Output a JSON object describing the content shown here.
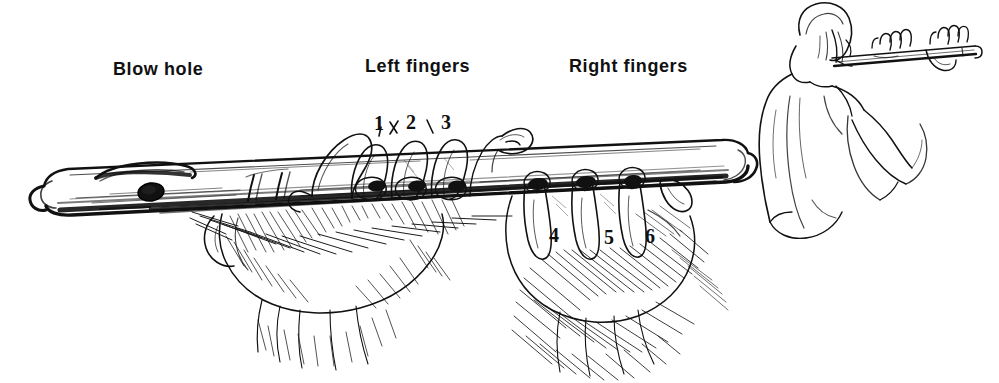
{
  "figure": {
    "background_color": "#ffffff",
    "ink_color": "#111111",
    "width": 999,
    "height": 383
  },
  "labels": [
    {
      "id": "blow-hole",
      "text": "Blow hole",
      "x": 113,
      "y": 60
    },
    {
      "id": "left-fingers",
      "text": "Left fingers",
      "x": 365,
      "y": 57
    },
    {
      "id": "right-fingers",
      "text": "Right fingers",
      "x": 569,
      "y": 57
    }
  ],
  "hole_numbers": [
    {
      "id": "hole-1",
      "text": "1",
      "x": 374,
      "y": 113,
      "hand": "left"
    },
    {
      "id": "hole-2",
      "text": "2",
      "x": 406,
      "y": 112,
      "hand": "left"
    },
    {
      "id": "hole-3",
      "text": "3",
      "x": 441,
      "y": 112,
      "hand": "left"
    },
    {
      "id": "hole-4",
      "text": "4",
      "x": 549,
      "y": 225,
      "hand": "right"
    },
    {
      "id": "hole-5",
      "text": "5",
      "x": 604,
      "y": 227,
      "hand": "right"
    },
    {
      "id": "hole-6",
      "text": "6",
      "x": 645,
      "y": 226,
      "hand": "right"
    }
  ],
  "flute": {
    "blow_hole": {
      "cx": 151,
      "cy": 192,
      "rx": 13,
      "ry": 9
    },
    "finger_holes": [
      {
        "n": 1,
        "cx": 377,
        "cy": 186
      },
      {
        "n": 2,
        "cx": 417,
        "cy": 186
      },
      {
        "n": 3,
        "cx": 457,
        "cy": 186
      },
      {
        "n": 4,
        "cx": 538,
        "cy": 184
      },
      {
        "n": 5,
        "cx": 586,
        "cy": 182
      },
      {
        "n": 6,
        "cx": 633,
        "cy": 181
      }
    ]
  },
  "inset": {
    "id": "player-figure",
    "description": "Seated player seen from behind holding transverse flute"
  }
}
